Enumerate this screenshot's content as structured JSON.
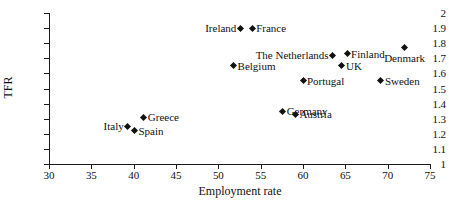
{
  "chart_data": {
    "type": "scatter",
    "title": "",
    "xlabel": "Employment rate",
    "ylabel": "TFR",
    "xlim": [
      30,
      75
    ],
    "ylim": [
      1,
      2
    ],
    "xticks": [
      "30",
      "35",
      "40",
      "45",
      "50",
      "55",
      "60",
      "65",
      "70",
      "75"
    ],
    "yticks": [
      "2",
      "1.9",
      "1.8",
      "1.7",
      "1.6",
      "1.5",
      "1.4",
      "1.3",
      "1.2",
      "1.1",
      "1"
    ],
    "grid": false,
    "legend": "none",
    "marker": "diamond",
    "marker_color": "#111111",
    "points": [
      {
        "label": "Ireland",
        "x": 52.6,
        "y": 1.9,
        "label_pos": "left"
      },
      {
        "label": "France",
        "x": 54.0,
        "y": 1.9,
        "label_pos": "right"
      },
      {
        "label": "Denmark",
        "x": 72.0,
        "y": 1.77,
        "label_pos": "below"
      },
      {
        "label": "Finland",
        "x": 65.2,
        "y": 1.73,
        "label_pos": "right"
      },
      {
        "label": "The Netherlands",
        "x": 63.5,
        "y": 1.72,
        "label_pos": "left"
      },
      {
        "label": "Belgium",
        "x": 51.8,
        "y": 1.65,
        "label_pos": "right"
      },
      {
        "label": "UK",
        "x": 64.6,
        "y": 1.65,
        "label_pos": "right"
      },
      {
        "label": "Portugal",
        "x": 60.0,
        "y": 1.55,
        "label_pos": "right"
      },
      {
        "label": "Sweden",
        "x": 69.2,
        "y": 1.55,
        "label_pos": "right"
      },
      {
        "label": "Germany",
        "x": 57.6,
        "y": 1.35,
        "label_pos": "right"
      },
      {
        "label": "Austria",
        "x": 59.1,
        "y": 1.33,
        "label_pos": "right"
      },
      {
        "label": "Greece",
        "x": 41.2,
        "y": 1.31,
        "label_pos": "right"
      },
      {
        "label": "Italy",
        "x": 39.3,
        "y": 1.25,
        "label_pos": "left"
      },
      {
        "label": "Spain",
        "x": 40.1,
        "y": 1.22,
        "label_pos": "right"
      }
    ]
  }
}
